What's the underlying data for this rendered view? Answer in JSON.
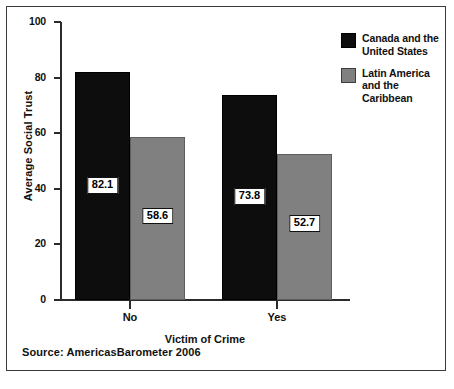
{
  "figure": {
    "source_note": "Source: AmericasBarometer 2006"
  },
  "chart_data": {
    "type": "bar",
    "title": "",
    "xlabel": "Victim of Crime",
    "ylabel": "Average Social Trust",
    "categories": [
      "No",
      "Yes"
    ],
    "ylim": [
      0,
      100
    ],
    "yticks": [
      0,
      20,
      40,
      60,
      80,
      100
    ],
    "ytick_labels": [
      "0",
      "20",
      "40",
      "60",
      "80",
      "100"
    ],
    "grid": false,
    "legend_position": "right",
    "series": [
      {
        "name": "Canada and the United States",
        "color": "#0d0d0d",
        "values": [
          82.1,
          58.6
        ],
        "value_labels": [
          "82.1",
          "73.8"
        ]
      },
      {
        "name": "Latin America and the Caribbean",
        "color": "#808080",
        "values": [
          58.6,
          52.7
        ],
        "value_labels": [
          "58.6",
          "52.7"
        ]
      }
    ],
    "points": [
      {
        "category": "No",
        "series": "Canada and the United States",
        "value": 82.1,
        "label": "82.1"
      },
      {
        "category": "No",
        "series": "Latin America and the Caribbean",
        "value": 58.6,
        "label": "58.6"
      },
      {
        "category": "Yes",
        "series": "Canada and the United States",
        "value": 73.8,
        "label": "73.8"
      },
      {
        "category": "Yes",
        "series": "Latin America and the Caribbean",
        "value": 52.7,
        "label": "52.7"
      }
    ]
  },
  "caption_sliver": ""
}
